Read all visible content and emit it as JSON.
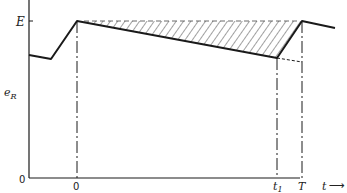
{
  "diagram": {
    "y_axis_label": "e",
    "y_axis_label_subscript": "R",
    "y_level_label": "E",
    "y_origin_label": "0",
    "x_labels": {
      "zero": "0",
      "t1": "t",
      "t1_subscript": "1",
      "T": "T",
      "t_axis": "t",
      "arrow": "⟶"
    },
    "colors": {
      "line": "#1a1a1a",
      "hatch": "#444444",
      "background": "#ffffff"
    }
  }
}
